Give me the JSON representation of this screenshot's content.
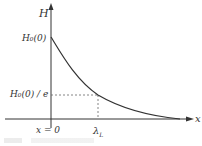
{
  "diagram": {
    "type": "exponential-decay-plot",
    "y_axis_label": "H",
    "x_axis_label": "x",
    "y_ticks": [
      "H₀(0)",
      "H₀(0) / e"
    ],
    "x_ticks": [
      "x = 0",
      "λ_L"
    ],
    "labels": {
      "H": "H",
      "x": "x",
      "H0": "H₀(0)",
      "H0e": "H₀(0) / e",
      "x0": "x = 0",
      "lambda": "λ",
      "lambda_sub": "L"
    },
    "curve": "H(x) = H₀(0)·exp(−x/λ_L)",
    "colors": {
      "axis": "#333333",
      "curve": "#333333",
      "dashed": "#555555"
    }
  }
}
